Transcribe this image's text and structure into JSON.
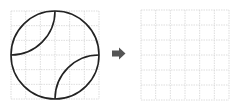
{
  "diagram": {
    "grid_rows": 6,
    "grid_cols": 6,
    "colors": {
      "grid_line": "#d4d4d4",
      "shape_stroke": "#222222",
      "arrow": "#555555",
      "background": "#ffffff"
    },
    "left_panel": {
      "label": "source figure",
      "shape": "circle with two inner quarter-circle arcs"
    },
    "arrow": {
      "icon": "right-arrow-icon"
    },
    "right_panel": {
      "label": "empty target grid"
    }
  }
}
